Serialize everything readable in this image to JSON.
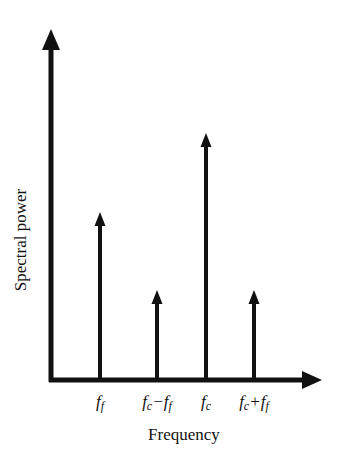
{
  "chart_data": {
    "type": "stem",
    "title": "",
    "xlabel": "Frequency",
    "ylabel": "Spectral power",
    "grid": false,
    "legend": null,
    "categories": [
      "f_f",
      "f_c−f_f",
      "f_c",
      "f_c+f_f"
    ],
    "tick_labels": [
      {
        "base": "f",
        "sub": "f",
        "text": ""
      },
      {
        "base": "f",
        "sub": "c",
        "text": "−",
        "base2": "f",
        "sub2": "f"
      },
      {
        "base": "f",
        "sub": "c",
        "text": ""
      },
      {
        "base": "f",
        "sub": "c",
        "text": "+",
        "base2": "f",
        "sub2": "f"
      }
    ],
    "values": [
      0.65,
      0.35,
      0.97,
      0.35
    ],
    "x_positions_px": [
      100,
      157,
      206,
      254
    ],
    "tip_y_px": [
      212,
      290,
      133,
      290
    ],
    "ylim": [
      0,
      1.35
    ]
  },
  "colors": {
    "ink": "#111111",
    "background": "#ffffff"
  }
}
